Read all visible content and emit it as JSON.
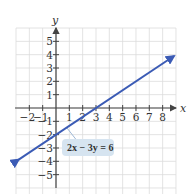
{
  "chart_data": {
    "type": "line",
    "title": "",
    "xlabel": "x",
    "ylabel": "y",
    "xlim": [
      -3,
      9
    ],
    "ylim": [
      -6,
      6
    ],
    "grid": true,
    "x_ticks": [
      -2,
      -1,
      1,
      2,
      3,
      4,
      5,
      6,
      7,
      8
    ],
    "y_ticks": [
      5,
      4,
      3,
      2,
      1,
      -1,
      -2,
      -3,
      -4,
      -5
    ],
    "series": [
      {
        "name": "2x − 3y = 6",
        "equation": "y = (2/3)x − 2",
        "x": [
          -2.8,
          0,
          3,
          8.85
        ],
        "y": [
          -3.87,
          -2,
          0,
          3.9
        ],
        "color": "#3b5bb5",
        "arrows": "both"
      }
    ],
    "annotations": [
      {
        "text": "2x − 3y = 6",
        "points_to": [
          0.8,
          -1.47
        ]
      }
    ]
  },
  "labels": {
    "x_axis": "x",
    "y_axis": "y",
    "equation": "2x − 3y = 6"
  },
  "colors": {
    "line": "#3b5bb5",
    "grid": "#dcdcdc",
    "axis": "#444444",
    "label_box": "#d6e4f0"
  }
}
